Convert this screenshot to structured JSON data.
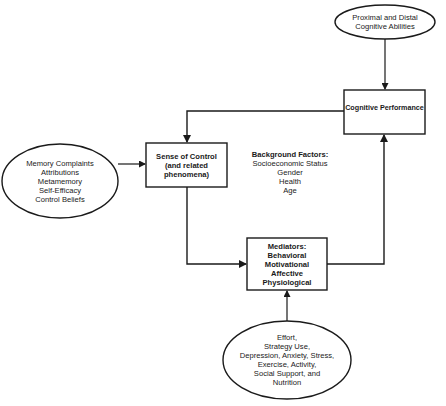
{
  "diagram": {
    "colors": {
      "stroke": "#1a1a1a",
      "background": "#ffffff",
      "text": "#1a1a1a"
    },
    "nodes": {
      "proximal_distal": {
        "shape": "ellipse",
        "lines": [
          "Proximal and Distal",
          "Cognitive Abilities"
        ]
      },
      "cognitive_performance": {
        "shape": "box",
        "lines": [
          "Cognitive Performance"
        ]
      },
      "memory_complaints": {
        "shape": "ellipse",
        "lines": [
          "Memory Complaints",
          "Attributions",
          "Metamemory",
          "Self-Efficacy",
          "Control Beliefs"
        ]
      },
      "sense_of_control": {
        "shape": "box",
        "lines": [
          "Sense of Control",
          "(and related",
          "phenomena)"
        ]
      },
      "background_factors": {
        "shape": "text",
        "title": "Background Factors:",
        "lines": [
          "Socioeconomic Status",
          "Gender",
          "Health",
          "Age"
        ]
      },
      "mediators": {
        "shape": "box",
        "lines": [
          "Mediators:",
          "Behavioral",
          "Motivational",
          "Affective",
          "Physiological"
        ]
      },
      "effort_etc": {
        "shape": "ellipse",
        "lines": [
          "Effort,",
          "Strategy Use,",
          "Depression, Anxiety, Stress,",
          "Exercise, Activity,",
          "Social Support, and",
          "Nutrition"
        ]
      }
    },
    "edges": [
      {
        "from": "proximal_distal",
        "to": "cognitive_performance"
      },
      {
        "from": "cognitive_performance",
        "to": "sense_of_control"
      },
      {
        "from": "memory_complaints",
        "to": "sense_of_control"
      },
      {
        "from": "sense_of_control",
        "to": "mediators"
      },
      {
        "from": "mediators",
        "to": "cognitive_performance"
      },
      {
        "from": "effort_etc",
        "to": "mediators"
      }
    ]
  }
}
